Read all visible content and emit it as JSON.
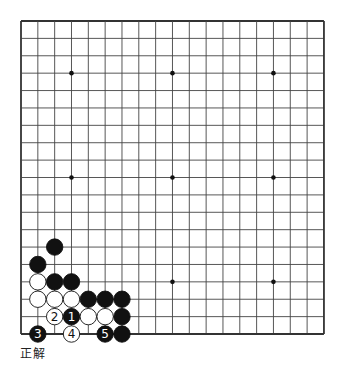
{
  "board": {
    "size": 19,
    "origin": {
      "x": 21,
      "y": 21
    },
    "spacing": {
      "x": 16.83,
      "y": 17.39
    },
    "stone_radius": 8.2,
    "line_color": "#444444",
    "border_color": "#333333",
    "star_points": [
      [
        3,
        3
      ],
      [
        9,
        3
      ],
      [
        15,
        3
      ],
      [
        3,
        9
      ],
      [
        9,
        9
      ],
      [
        15,
        9
      ],
      [
        3,
        15
      ],
      [
        9,
        15
      ],
      [
        15,
        15
      ]
    ],
    "stones": [
      {
        "col": 2,
        "row": 13,
        "color": "black"
      },
      {
        "col": 1,
        "row": 14,
        "color": "black"
      },
      {
        "col": 1,
        "row": 15,
        "color": "white"
      },
      {
        "col": 2,
        "row": 15,
        "color": "black"
      },
      {
        "col": 3,
        "row": 15,
        "color": "black"
      },
      {
        "col": 1,
        "row": 16,
        "color": "white"
      },
      {
        "col": 2,
        "row": 16,
        "color": "white"
      },
      {
        "col": 3,
        "row": 16,
        "color": "white"
      },
      {
        "col": 4,
        "row": 16,
        "color": "black"
      },
      {
        "col": 5,
        "row": 16,
        "color": "black"
      },
      {
        "col": 6,
        "row": 16,
        "color": "black"
      },
      {
        "col": 2,
        "row": 17,
        "color": "white",
        "label": "2"
      },
      {
        "col": 3,
        "row": 17,
        "color": "black",
        "label": "1"
      },
      {
        "col": 4,
        "row": 17,
        "color": "white"
      },
      {
        "col": 5,
        "row": 17,
        "color": "white"
      },
      {
        "col": 6,
        "row": 17,
        "color": "black"
      },
      {
        "col": 1,
        "row": 18,
        "color": "black",
        "label": "3"
      },
      {
        "col": 3,
        "row": 18,
        "color": "white",
        "label": "4"
      },
      {
        "col": 5,
        "row": 18,
        "color": "black",
        "label": "5"
      },
      {
        "col": 6,
        "row": 18,
        "color": "black"
      }
    ]
  },
  "caption": "正解"
}
